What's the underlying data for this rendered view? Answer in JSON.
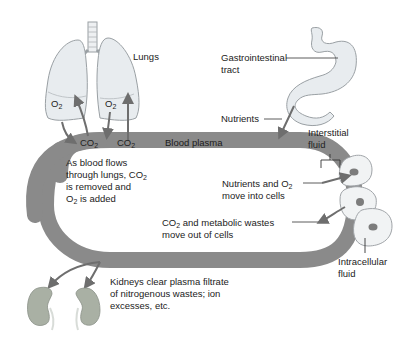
{
  "diagram": {
    "labels": {
      "lungs": "Lungs",
      "gi_tract_line1": "Gastrointestinal",
      "gi_tract_line2": "tract",
      "nutrients": "Nutrients",
      "interstitial_line1": "Interstitial",
      "interstitial_line2": "fluid",
      "blood_plasma": "Blood plasma",
      "o2_left": "O",
      "o2_right": "O",
      "co2_left": "CO",
      "co2_right": "CO",
      "sub2": "2",
      "lungs_desc_line1": "As blood flows",
      "lungs_desc_line2a": "through lungs, CO",
      "lungs_desc_line3": "is removed and",
      "lungs_desc_line4a": "O",
      "lungs_desc_line4b": " is added",
      "nutrients_o2_line1a": "Nutrients and O",
      "nutrients_o2_line2": "move into cells",
      "wastes_line1a": "CO",
      "wastes_line1b": " and metabolic wastes",
      "wastes_line2": "move out of cells",
      "kidneys_line1": "Kidneys clear plasma filtrate",
      "kidneys_line2": "of nitrogenous wastes; ion",
      "kidneys_line3": "excesses, etc.",
      "intracellular_line1": "Intracellular",
      "intracellular_line2": "fluid"
    },
    "colors": {
      "plasma_band": "#8a8a8a",
      "organ_fill": "#e8ecef",
      "organ_stroke": "#9aa0a4",
      "kidney_fill": "#a9b0a4",
      "arrow": "#6e6e6e",
      "nucleus": "#7c7c7c"
    }
  }
}
